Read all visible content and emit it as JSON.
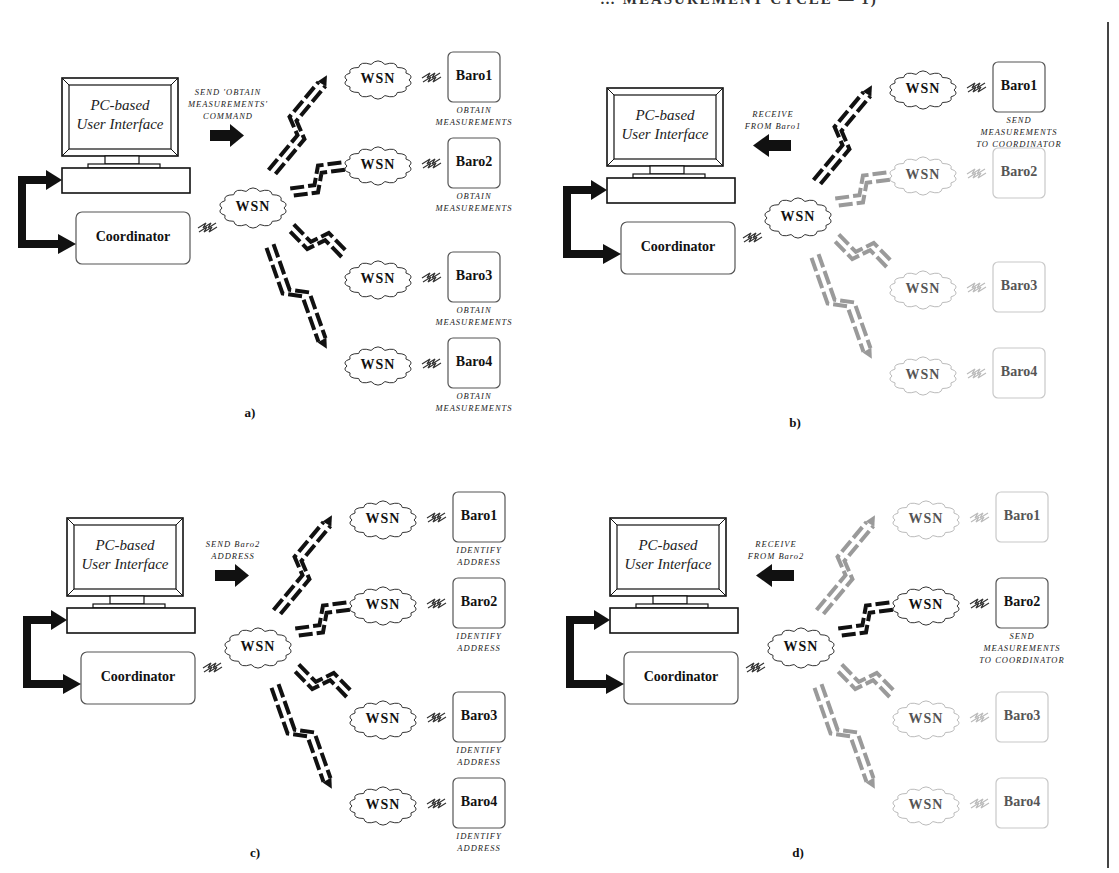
{
  "figure": {
    "header_fragment": "… MEASUREMENT CYCLE — 1)",
    "colors": {
      "active": "#111111",
      "inactive": "#9a9a9a",
      "inactive_border": "#c8c8c8"
    },
    "common": {
      "pc_label_line1": "PC-based",
      "pc_label_line2": "User Interface",
      "coordinator_label": "Coordinator",
      "wsn_label": "WSN"
    },
    "panels": [
      {
        "id": "a",
        "label": "a)",
        "pc_arrow": {
          "direction": "right",
          "caption": [
            "SEND 'OBTAIN",
            "MEASUREMENTS'",
            "COMMAND"
          ]
        },
        "nodes": [
          {
            "name": "Baro1",
            "active": true,
            "caption": [
              "OBTAIN",
              "MEASUREMENTS"
            ]
          },
          {
            "name": "Baro2",
            "active": true,
            "caption": [
              "OBTAIN",
              "MEASUREMENTS"
            ]
          },
          {
            "name": "Baro3",
            "active": true,
            "caption": [
              "OBTAIN",
              "MEASUREMENTS"
            ]
          },
          {
            "name": "Baro4",
            "active": true,
            "caption": [
              "OBTAIN",
              "MEASUREMENTS"
            ]
          }
        ]
      },
      {
        "id": "b",
        "label": "b)",
        "pc_arrow": {
          "direction": "left",
          "caption": [
            "RECEIVE",
            "FROM Baro1"
          ]
        },
        "nodes": [
          {
            "name": "Baro1",
            "active": true,
            "caption": [
              "SEND",
              "MEASUREMENTS",
              "TO COORDINATOR"
            ]
          },
          {
            "name": "Baro2",
            "active": false,
            "caption": []
          },
          {
            "name": "Baro3",
            "active": false,
            "caption": []
          },
          {
            "name": "Baro4",
            "active": false,
            "caption": []
          }
        ]
      },
      {
        "id": "c",
        "label": "c)",
        "pc_arrow": {
          "direction": "right",
          "caption": [
            "SEND Baro2",
            "ADDRESS"
          ]
        },
        "nodes": [
          {
            "name": "Baro1",
            "active": true,
            "caption": [
              "IDENTIFY",
              "ADDRESS"
            ]
          },
          {
            "name": "Baro2",
            "active": true,
            "caption": [
              "IDENTIFY",
              "ADDRESS"
            ]
          },
          {
            "name": "Baro3",
            "active": true,
            "caption": [
              "IDENTIFY",
              "ADDRESS"
            ]
          },
          {
            "name": "Baro4",
            "active": true,
            "caption": [
              "IDENTIFY",
              "ADDRESS"
            ]
          }
        ]
      },
      {
        "id": "d",
        "label": "d)",
        "pc_arrow": {
          "direction": "left",
          "caption": [
            "RECEIVE",
            "FROM Baro2"
          ]
        },
        "nodes": [
          {
            "name": "Baro1",
            "active": false,
            "caption": []
          },
          {
            "name": "Baro2",
            "active": true,
            "caption": [
              "SEND",
              "MEASUREMENTS",
              "TO COORDINATOR"
            ]
          },
          {
            "name": "Baro3",
            "active": false,
            "caption": []
          },
          {
            "name": "Baro4",
            "active": false,
            "caption": []
          }
        ]
      }
    ]
  }
}
